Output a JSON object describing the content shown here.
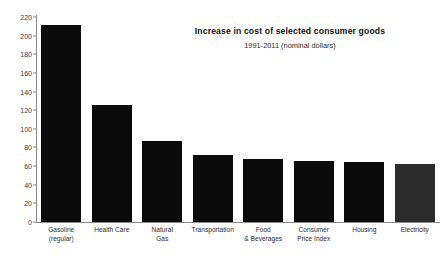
{
  "chart_data": {
    "type": "bar",
    "title": "Increase in cost of selected consumer goods",
    "subtitle": "1991-2011 (nominal dollars)",
    "xlabel": "",
    "ylabel": "",
    "ylim": [
      0,
      220
    ],
    "ytick_step": 20,
    "grid": false,
    "legend": null,
    "categories": [
      "Gasoline (regular)",
      "Health Care",
      "Natural Gas",
      "Transportation",
      "Food & Beverages",
      "Consumer Price Index",
      "Housing",
      "Electricity"
    ],
    "category_lines": [
      [
        "Gasoline",
        "(regular)"
      ],
      [
        "Health Care"
      ],
      [
        "Natural",
        "Gas"
      ],
      [
        "Transportation"
      ],
      [
        "Food",
        "& Beverages"
      ],
      [
        "Consumer",
        "Price Index"
      ],
      [
        "Housing"
      ],
      [
        "Electricity"
      ]
    ],
    "values": [
      211,
      126,
      87,
      72,
      68,
      65,
      64,
      62
    ],
    "ytick_labels": [
      "220",
      "200",
      "180",
      "160",
      "140",
      "120",
      "100",
      "80",
      "60",
      "40",
      "20",
      "0"
    ],
    "ytick_values": [
      220,
      200,
      180,
      160,
      140,
      120,
      100,
      80,
      60,
      40,
      20,
      0
    ],
    "bar_colors": [
      "#0a0a0a",
      "#0a0a0a",
      "#0a0a0a",
      "#0a0a0a",
      "#0a0a0a",
      "#0a0a0a",
      "#0a0a0a",
      "#2b2b2b"
    ],
    "axis_color": "#8a8a8a",
    "background_color": "#ffffff",
    "text_color": "#2b2b2b"
  }
}
